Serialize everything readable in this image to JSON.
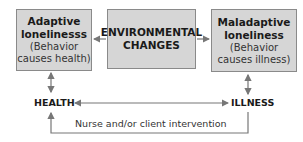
{
  "boxes": {
    "left": {
      "title1": "Adaptive",
      "title2": "lonelinesss",
      "note1": "(Behavior",
      "note2": "causes health)"
    },
    "middle": {
      "title1": "ENVIRONMENTAL",
      "title2": "CHANGES"
    },
    "right": {
      "title1": "Maladaptive",
      "title2": "loneliness",
      "note1": "(Behavior",
      "note2": "causes illness)"
    }
  },
  "nodes": {
    "health": "HEALTH",
    "illness": "ILLNESS"
  },
  "feedback_label": "Nurse and/or client intervention",
  "colors": {
    "box_fill": "#d6d6d6",
    "arrow": "#777777"
  }
}
